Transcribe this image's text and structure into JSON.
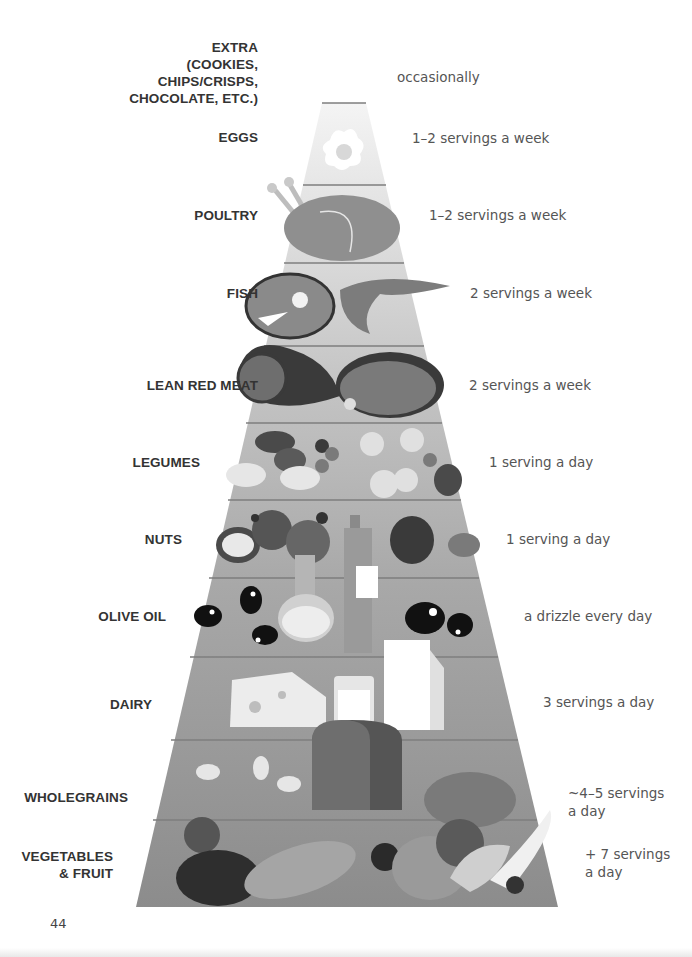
{
  "diagram": {
    "type": "food-pyramid",
    "title": "",
    "page_number": "44",
    "tiers": [
      {
        "name": "EXTRA\n(COOKIES,\nCHIPS/CRISPS,\nCHOCOLATE, ETC.)",
        "serving": "occasionally",
        "icons": []
      },
      {
        "name": "EGGS",
        "serving": "1–2 servings a week",
        "icons": [
          "fried-egg-icon"
        ]
      },
      {
        "name": "POULTRY",
        "serving": "1–2 servings a week",
        "icons": [
          "roast-chicken-icon"
        ]
      },
      {
        "name": "FISH",
        "serving": "2 servings a week",
        "icons": [
          "salmon-steak-icon",
          "shrimp-icon"
        ]
      },
      {
        "name": "LEAN RED MEAT",
        "serving": "2 servings a week",
        "icons": [
          "ham-icon",
          "steak-icon"
        ]
      },
      {
        "name": "LEGUMES",
        "serving": "1 serving a day",
        "icons": [
          "kidney-bean-icon",
          "chickpea-icon",
          "lentil-icon"
        ]
      },
      {
        "name": "NUTS",
        "serving": "1 serving a day",
        "icons": [
          "walnut-icon",
          "hazelnut-icon",
          "almond-icon"
        ]
      },
      {
        "name": "OLIVE OIL",
        "serving": "a drizzle every day",
        "icons": [
          "olive-icon",
          "oil-carafe-icon",
          "oil-bottle-icon"
        ]
      },
      {
        "name": "DAIRY",
        "serving": "3 servings a day",
        "icons": [
          "cheese-icon",
          "milk-glass-icon",
          "milk-carton-icon"
        ]
      },
      {
        "name": "WHOLEGRAINS",
        "serving": "~4–5 servings\na day",
        "icons": [
          "oat-icon",
          "bread-loaf-icon",
          "bread-roll-icon"
        ]
      },
      {
        "name": "VEGETABLES\n& FRUIT",
        "serving": "+ 7 servings\na day",
        "icons": [
          "tomato-icon",
          "eggplant-icon",
          "corn-icon",
          "blueberry-icon",
          "apple-icon",
          "banana-icon"
        ]
      }
    ],
    "colors": {
      "tier_top": "#eeeeee",
      "tier_bottom": "#8a8a8a",
      "divider": "#7a7a7a",
      "label_text": "#333333",
      "serving_text": "#555555"
    }
  }
}
